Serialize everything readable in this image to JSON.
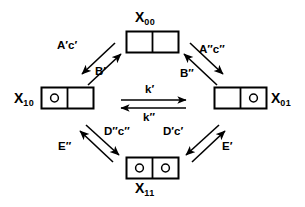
{
  "diagram": {
    "stroke_color": "#000000",
    "background_color": "#ffffff",
    "nodes": [
      {
        "id": "X00",
        "name": "node-x00",
        "label_base": "X",
        "label_sub": "00",
        "occupancy": [
          false,
          false
        ],
        "position": "top"
      },
      {
        "id": "X10",
        "name": "node-x10",
        "label_base": "X",
        "label_sub": "10",
        "occupancy": [
          true,
          false
        ],
        "position": "left"
      },
      {
        "id": "X01",
        "name": "node-x01",
        "label_base": "X",
        "label_sub": "01",
        "occupancy": [
          false,
          true
        ],
        "position": "right"
      },
      {
        "id": "X11",
        "name": "node-x11",
        "label_base": "X",
        "label_sub": "11",
        "occupancy": [
          true,
          true
        ],
        "position": "bottom"
      }
    ],
    "edges": [
      {
        "id": "x00-to-x10",
        "name": "rate-label-a-prime-c-prime",
        "text": "A′c′",
        "from": "X00",
        "to": "X10",
        "direction": "down-left"
      },
      {
        "id": "x10-to-x00",
        "name": "rate-label-b-prime",
        "text": "B′",
        "from": "X10",
        "to": "X00",
        "direction": "up-right"
      },
      {
        "id": "x00-to-x01",
        "name": "rate-label-a-dprime-c-dprime",
        "text": "A″c″",
        "from": "X00",
        "to": "X01",
        "direction": "down-right"
      },
      {
        "id": "x01-to-x00",
        "name": "rate-label-b-dprime",
        "text": "B″",
        "from": "X01",
        "to": "X00",
        "direction": "up-left"
      },
      {
        "id": "x10-to-x01",
        "name": "rate-label-k-prime",
        "text": "k′",
        "from": "X10",
        "to": "X01",
        "direction": "right"
      },
      {
        "id": "x01-to-x10",
        "name": "rate-label-k-dprime",
        "text": "k″",
        "from": "X01",
        "to": "X10",
        "direction": "left"
      },
      {
        "id": "x10-to-x11",
        "name": "rate-label-d-dprime-c-dprime",
        "text": "D″c″",
        "from": "X10",
        "to": "X11",
        "direction": "down-right"
      },
      {
        "id": "x11-to-x10",
        "name": "rate-label-e-dprime",
        "text": "E″",
        "from": "X11",
        "to": "X10",
        "direction": "up-left"
      },
      {
        "id": "x01-to-x11",
        "name": "rate-label-d-prime-c-prime",
        "text": "D′c′",
        "from": "X01",
        "to": "X11",
        "direction": "down-left"
      },
      {
        "id": "x11-to-x01",
        "name": "rate-label-e-prime",
        "text": "E′",
        "from": "X11",
        "to": "X01",
        "direction": "up-right"
      }
    ]
  }
}
